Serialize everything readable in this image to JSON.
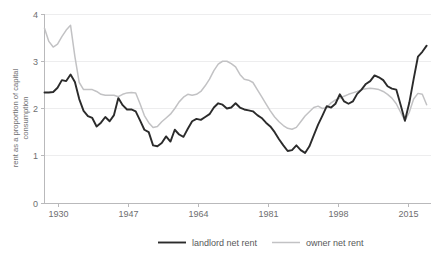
{
  "chart_data": {
    "type": "line",
    "title": "",
    "subtitle": "",
    "xlabel": "",
    "ylabel": "rent as a proportion of capital consumption",
    "ylabel_line1": "rent as a proportion of capital",
    "ylabel_line2": "consumption",
    "xlim": [
      1929,
      2018
    ],
    "ylim": [
      0,
      4
    ],
    "yticks": [
      "0",
      "1",
      "2",
      "3",
      "4"
    ],
    "ytick_values": [
      0,
      1,
      2,
      3,
      4
    ],
    "xticks": [
      "1930",
      "1947",
      "1964",
      "1981",
      "1998",
      "2015"
    ],
    "xtick_values": [
      1930,
      1947,
      1964,
      1981,
      1998,
      2015
    ],
    "grid": "horizontal",
    "legend_position": "bottom",
    "colors": {
      "landlord_net_rent": "#2b2b2b",
      "owner_net_rent": "#c2c2c4",
      "gridline": "#ededee",
      "axis": "#b9b9bb",
      "text": "#6e6e70"
    },
    "series": [
      {
        "name": "landlord net rent",
        "color": "#2b2b2b",
        "x": [
          1929,
          1930,
          1931,
          1932,
          1933,
          1934,
          1935,
          1936,
          1937,
          1938,
          1939,
          1940,
          1941,
          1942,
          1943,
          1944,
          1945,
          1946,
          1947,
          1948,
          1949,
          1950,
          1951,
          1952,
          1953,
          1954,
          1955,
          1956,
          1957,
          1958,
          1959,
          1960,
          1961,
          1962,
          1963,
          1964,
          1965,
          1966,
          1967,
          1968,
          1969,
          1970,
          1971,
          1972,
          1973,
          1974,
          1975,
          1976,
          1977,
          1978,
          1979,
          1980,
          1981,
          1982,
          1983,
          1984,
          1985,
          1986,
          1987,
          1988,
          1989,
          1990,
          1991,
          1992,
          1993,
          1994,
          1995,
          1996,
          1997,
          1998,
          1999,
          2000,
          2001,
          2002,
          2003,
          2004,
          2005,
          2006,
          2007,
          2008,
          2009,
          2010,
          2011,
          2012,
          2013,
          2014,
          2015,
          2016,
          2017
        ],
        "values": [
          2.34,
          2.34,
          2.35,
          2.44,
          2.6,
          2.58,
          2.72,
          2.56,
          2.2,
          1.95,
          1.84,
          1.8,
          1.62,
          1.7,
          1.82,
          1.73,
          1.86,
          2.22,
          2.07,
          1.98,
          1.98,
          1.94,
          1.75,
          1.55,
          1.5,
          1.22,
          1.2,
          1.27,
          1.41,
          1.3,
          1.55,
          1.45,
          1.4,
          1.57,
          1.73,
          1.78,
          1.76,
          1.82,
          1.88,
          2.02,
          2.11,
          2.08,
          2.0,
          2.02,
          2.11,
          2.02,
          1.98,
          1.96,
          1.94,
          1.86,
          1.8,
          1.7,
          1.62,
          1.5,
          1.35,
          1.22,
          1.1,
          1.12,
          1.22,
          1.12,
          1.06,
          1.2,
          1.43,
          1.66,
          1.85,
          2.05,
          2.02,
          2.1,
          2.3,
          2.15,
          2.1,
          2.15,
          2.31,
          2.4,
          2.52,
          2.58,
          2.7,
          2.66,
          2.6,
          2.47,
          2.42,
          2.4,
          2.08,
          1.74,
          2.12,
          2.62,
          3.1,
          3.2,
          3.33
        ],
        "start_value": 2.34,
        "end_value": 3.33,
        "min_value": 1.06,
        "max_value": 3.33
      },
      {
        "name": "owner net rent",
        "color": "#c2c2c4",
        "x": [
          1929,
          1930,
          1931,
          1932,
          1933,
          1934,
          1935,
          1936,
          1937,
          1938,
          1939,
          1940,
          1941,
          1942,
          1943,
          1944,
          1945,
          1946,
          1947,
          1948,
          1949,
          1950,
          1951,
          1952,
          1953,
          1954,
          1955,
          1956,
          1957,
          1958,
          1959,
          1960,
          1961,
          1962,
          1963,
          1964,
          1965,
          1966,
          1967,
          1968,
          1969,
          1970,
          1971,
          1972,
          1973,
          1974,
          1975,
          1976,
          1977,
          1978,
          1979,
          1980,
          1981,
          1982,
          1983,
          1984,
          1985,
          1986,
          1987,
          1988,
          1989,
          1990,
          1991,
          1992,
          1993,
          1994,
          1995,
          1996,
          1997,
          1998,
          1999,
          2000,
          2001,
          2002,
          2003,
          2004,
          2005,
          2006,
          2007,
          2008,
          2009,
          2010,
          2011,
          2012,
          2013,
          2014,
          2015,
          2016,
          2017
        ],
        "values": [
          3.7,
          3.42,
          3.3,
          3.36,
          3.52,
          3.66,
          3.76,
          3.1,
          2.55,
          2.4,
          2.4,
          2.4,
          2.36,
          2.3,
          2.28,
          2.28,
          2.28,
          2.25,
          2.3,
          2.33,
          2.34,
          2.33,
          2.1,
          1.85,
          1.7,
          1.6,
          1.62,
          1.72,
          1.8,
          1.88,
          2.0,
          2.14,
          2.24,
          2.3,
          2.28,
          2.3,
          2.36,
          2.48,
          2.62,
          2.8,
          2.94,
          3.0,
          3.0,
          2.95,
          2.88,
          2.72,
          2.62,
          2.6,
          2.55,
          2.4,
          2.25,
          2.1,
          1.95,
          1.82,
          1.72,
          1.64,
          1.58,
          1.56,
          1.6,
          1.72,
          1.84,
          1.93,
          2.02,
          2.05,
          2.0,
          2.02,
          2.12,
          2.18,
          2.22,
          2.26,
          2.3,
          2.33,
          2.36,
          2.4,
          2.42,
          2.43,
          2.42,
          2.4,
          2.36,
          2.3,
          2.22,
          2.1,
          1.92,
          1.74,
          1.92,
          2.2,
          2.32,
          2.3,
          2.08
        ],
        "start_value": 3.7,
        "end_value": 2.08,
        "min_value": 1.56,
        "max_value": 3.76
      }
    ]
  },
  "legend": {
    "items": [
      {
        "label": "landlord net rent",
        "color": "#2b2b2b"
      },
      {
        "label": "owner net rent",
        "color": "#c2c2c4"
      }
    ]
  }
}
